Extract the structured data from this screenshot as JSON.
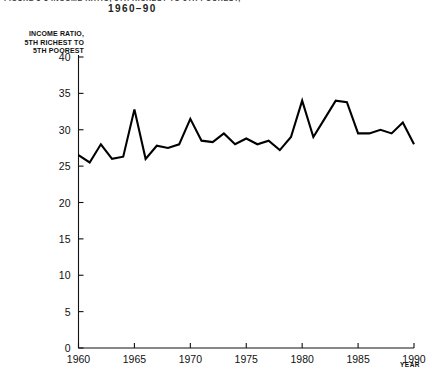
{
  "figure": {
    "heading_line": "FIGURE 3-3   INCOME RATIO, 5TH RICHEST TO 5TH POOREST,",
    "subtitle": "1960–90"
  },
  "axes": {
    "y_title": "INCOME RATIO,\n5TH RICHEST TO\n5TH POOREST",
    "y_title_line1": "INCOME RATIO,",
    "y_title_line2": "5TH RICHEST TO",
    "y_title_line3": "5TH POOREST",
    "x_caption": "YEAR"
  },
  "chart_data": {
    "type": "line",
    "xlabel": "YEAR",
    "ylabel": "INCOME RATIO, 5TH RICHEST TO 5TH POOREST",
    "xlim": [
      1960,
      1990
    ],
    "ylim": [
      0,
      40
    ],
    "xticks": [
      1960,
      1965,
      1970,
      1975,
      1980,
      1985,
      1990
    ],
    "yticks": [
      0,
      5,
      10,
      15,
      20,
      25,
      30,
      35,
      40
    ],
    "xtick_labels": [
      "1960",
      "1965",
      "1970",
      "1975",
      "1980",
      "1985",
      "1990"
    ],
    "ytick_labels": [
      "0",
      "5",
      "10",
      "15",
      "20",
      "25",
      "30",
      "35",
      "40"
    ],
    "grid": false,
    "legend": false,
    "line_color": "#000000",
    "x": [
      1960,
      1961,
      1962,
      1963,
      1964,
      1965,
      1966,
      1967,
      1968,
      1969,
      1970,
      1971,
      1972,
      1973,
      1974,
      1975,
      1976,
      1977,
      1978,
      1979,
      1980,
      1981,
      1982,
      1983,
      1984,
      1985,
      1986,
      1987,
      1988,
      1989,
      1990
    ],
    "values": [
      26.5,
      25.5,
      28.0,
      26.0,
      26.3,
      32.8,
      26.0,
      27.8,
      27.5,
      28.0,
      31.5,
      28.5,
      28.3,
      29.5,
      28.0,
      28.8,
      28.0,
      28.5,
      27.2,
      29.0,
      34.0,
      29.0,
      31.5,
      34.0,
      33.8,
      29.5,
      29.5,
      30.0,
      29.5,
      31.0,
      28.0
    ],
    "series": [
      {
        "name": "Income ratio, 5th richest to 5th poorest",
        "values": [
          26.5,
          25.5,
          28.0,
          26.0,
          26.3,
          32.8,
          26.0,
          27.8,
          27.5,
          28.0,
          31.5,
          28.5,
          28.3,
          29.5,
          28.0,
          28.8,
          28.0,
          28.5,
          27.2,
          29.0,
          34.0,
          29.0,
          31.5,
          34.0,
          33.8,
          29.5,
          29.5,
          30.0,
          29.5,
          31.0,
          28.0
        ]
      }
    ],
    "annotations": [
      {
        "label": "peak",
        "x": 1965,
        "y": 32.8
      },
      {
        "label": "peak",
        "x": 1980,
        "y": 34.0
      },
      {
        "label": "peak",
        "x": 1983,
        "y": 34.0
      }
    ]
  }
}
